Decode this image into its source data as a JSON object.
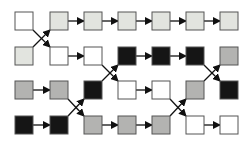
{
  "colors": {
    "white": "#ffffff",
    "light": "#e2e4df",
    "mid": "#b3b3b1",
    "black": "#151515",
    "stroke": "#555555",
    "line": "#111111"
  },
  "layout": {
    "col_x": [
      15,
      50,
      84,
      118,
      152,
      186,
      220
    ],
    "row_y": [
      12,
      47,
      81,
      116
    ],
    "size": 18
  },
  "grid": [
    [
      "white",
      "light",
      "light",
      "light",
      "light",
      "light",
      "light"
    ],
    [
      "light",
      "white",
      "white",
      "black",
      "black",
      "black",
      "mid"
    ],
    [
      "mid",
      "mid",
      "black",
      "white",
      "white",
      "mid",
      "black"
    ],
    [
      "black",
      "black",
      "mid",
      "mid",
      "mid",
      "white",
      "white"
    ]
  ],
  "crossings": [
    {
      "from_col": 0,
      "rows": [
        0,
        1
      ]
    },
    {
      "from_col": 2,
      "rows": [
        1,
        2
      ]
    },
    {
      "from_col": 1,
      "rows": [
        2,
        3
      ]
    },
    {
      "from_col": 5,
      "rows": [
        1,
        2
      ]
    },
    {
      "from_col": 4,
      "rows": [
        2,
        3
      ]
    }
  ]
}
